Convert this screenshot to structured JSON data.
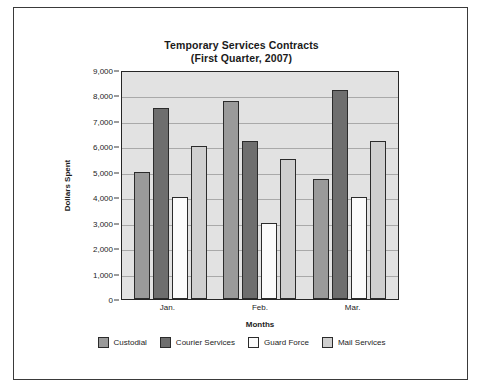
{
  "chart_data": {
    "type": "bar",
    "title": "Temporary Services Contracts",
    "subtitle": "(First Quarter, 2007)",
    "xlabel": "Months",
    "ylabel": "Dollars Spent",
    "categories": [
      "Jan.",
      "Feb.",
      "Mar."
    ],
    "ylim": [
      0,
      9000
    ],
    "ytick_step": 1000,
    "ytick_labels": [
      "9,000",
      "8,000",
      "7,000",
      "6,000",
      "5,000",
      "4,000",
      "3,000",
      "2,000",
      "1,000",
      "0"
    ],
    "ytick_values": [
      9000,
      8000,
      7000,
      6000,
      5000,
      4000,
      3000,
      2000,
      1000,
      0
    ],
    "grid": true,
    "legend_position": "bottom",
    "plot_background": "#e2e2e2",
    "series": [
      {
        "name": "Custodial",
        "color": "#9a9a9a",
        "values": [
          5000,
          7800,
          4700
        ]
      },
      {
        "name": "Courier Services",
        "color": "#6e6e6e",
        "values": [
          7500,
          6200,
          8200
        ]
      },
      {
        "name": "Guard Force",
        "color": "#fbfbfb",
        "values": [
          4000,
          3000,
          4000
        ]
      },
      {
        "name": "Mail Services",
        "color": "#cfcfcf",
        "values": [
          6000,
          5500,
          6200
        ]
      }
    ]
  }
}
